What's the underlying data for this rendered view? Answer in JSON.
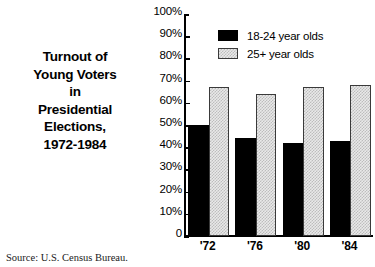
{
  "title_lines": [
    "Turnout of",
    "Young Voters",
    "in",
    "Presidential",
    "Elections,",
    "1972-1984"
  ],
  "source": "Source: U.S. Census Bureau.",
  "legend": {
    "entries": [
      {
        "label": "18-24 year olds",
        "swatch": "black-swatch"
      },
      {
        "label": "25+ year olds",
        "swatch": "stipple-swatch"
      }
    ]
  },
  "axis": {
    "y_ticks": [
      "100%",
      "90%",
      "80%",
      "70%",
      "60%",
      "50%",
      "40%",
      "30%",
      "20%",
      "10%",
      "0"
    ],
    "x_ticks": [
      "'72",
      "'76",
      "'80",
      "'84"
    ]
  },
  "colors": {
    "series_1": "#000000",
    "series_2": "#d8d8d8",
    "axis": "#000000",
    "background": "#ffffff"
  },
  "chart_data": {
    "type": "bar",
    "title": "Turnout of Young Voters in Presidential Elections, 1972-1984",
    "subtitle": "",
    "xlabel": "",
    "ylabel": "",
    "ylim": [
      0,
      100
    ],
    "yticks": [
      0,
      10,
      20,
      30,
      40,
      50,
      60,
      70,
      80,
      90,
      100
    ],
    "ytick_labels": [
      "0",
      "10%",
      "20%",
      "30%",
      "40%",
      "50%",
      "60%",
      "70%",
      "80%",
      "90%",
      "100%"
    ],
    "grid": false,
    "legend_position": "top-center",
    "categories": [
      "'72",
      "'76",
      "'80",
      "'84"
    ],
    "category_years": [
      1972,
      1976,
      1980,
      1984
    ],
    "units": "percent",
    "series": [
      {
        "name": "18-24 year olds",
        "color": "#000000",
        "values": [
          50,
          44,
          42,
          43
        ]
      },
      {
        "name": "25+ year olds",
        "color": "#d8d8d8",
        "values": [
          67,
          64,
          67,
          68
        ]
      }
    ],
    "source": "Source: U.S. Census Bureau."
  }
}
